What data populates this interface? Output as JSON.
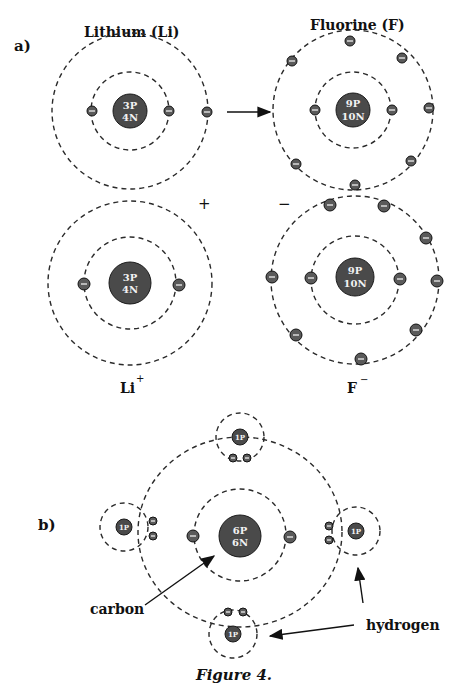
{
  "panel_a": {
    "label": "a)",
    "lithium": {
      "title": "Lithium (Li)",
      "nucleus_line1": "3P",
      "nucleus_line2": "4N"
    },
    "fluorine": {
      "title": "Fluorine (F)",
      "nucleus_line1": "9P",
      "nucleus_line2": "10N"
    },
    "lithium_ion": {
      "label": "Li",
      "charge": "+",
      "nucleus_line1": "3P",
      "nucleus_line2": "4N"
    },
    "fluoride_ion": {
      "label": "F",
      "charge": "−",
      "nucleus_line1": "9P",
      "nucleus_line2": "10N"
    },
    "plus_sign": "+",
    "minus_sign": "−"
  },
  "panel_b": {
    "label": "b)",
    "carbon": {
      "nucleus_line1": "6P",
      "nucleus_line2": "6N",
      "label": "carbon"
    },
    "hydrogen": {
      "nucleus": "1P",
      "label": "hydrogen"
    }
  },
  "caption": "Figure 4.",
  "icons": {
    "electron": "minus-circle",
    "arrow": "arrow-right"
  }
}
